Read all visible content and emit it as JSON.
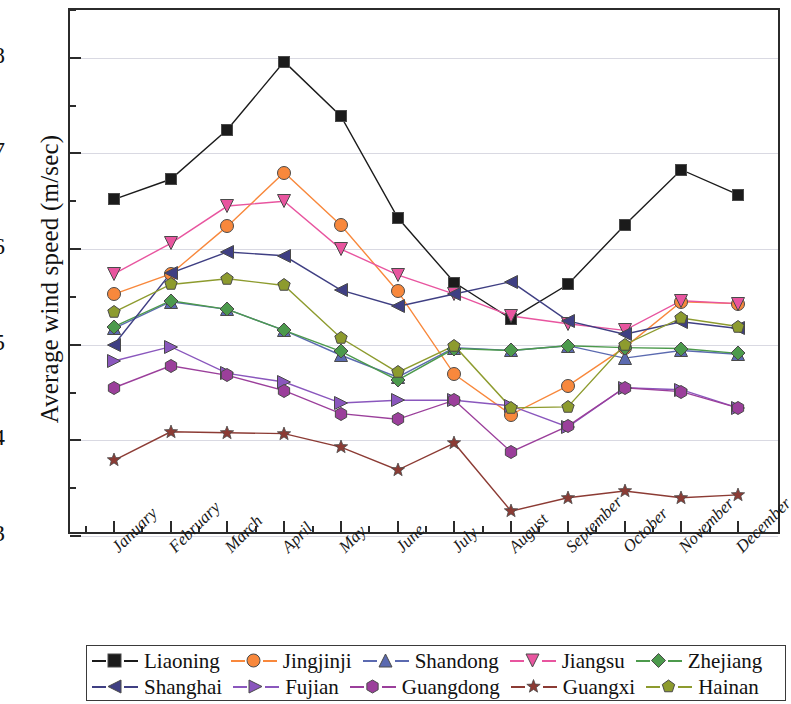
{
  "chart_data": {
    "type": "line",
    "title": "",
    "xlabel": "",
    "ylabel": "Average wind speed (m/sec)",
    "ylim": [
      3,
      8.5
    ],
    "yticks": [
      3,
      4,
      5,
      6,
      7,
      8
    ],
    "ytick_labels": [
      "3",
      "4",
      "5",
      "6",
      "7",
      "8"
    ],
    "minor_yticks": [
      3.5,
      4.5,
      5.5,
      6.5,
      7.5,
      8.5
    ],
    "grid": true,
    "grid_axis": "y",
    "legend_position": "bottom",
    "legend_columns": 5,
    "legend_rows": 2,
    "categories": [
      "January",
      "February",
      "March",
      "April",
      "May",
      "June",
      "July",
      "August",
      "September",
      "October",
      "November",
      "December"
    ],
    "series": [
      {
        "name": "Liaoning",
        "color": "#1b1b1b",
        "marker": "square",
        "values": [
          6.52,
          6.73,
          7.25,
          7.96,
          7.39,
          6.33,
          5.65,
          5.27,
          5.63,
          6.25,
          6.83,
          6.57
        ]
      },
      {
        "name": "Jingjinji",
        "color": "#f8883c",
        "marker": "circle",
        "values": [
          5.53,
          5.74,
          6.24,
          6.8,
          6.25,
          5.56,
          4.69,
          4.27,
          4.57,
          4.97,
          5.45,
          5.43
        ]
      },
      {
        "name": "Shandong",
        "color": "#5b6ab0",
        "marker": "triangle-up",
        "values": [
          5.17,
          5.45,
          5.37,
          5.15,
          4.89,
          4.66,
          4.97,
          4.94,
          4.99,
          4.86,
          4.94,
          4.9
        ]
      },
      {
        "name": "Jiangsu",
        "color": "#e8559f",
        "marker": "triangle-down",
        "values": [
          5.74,
          6.06,
          6.45,
          6.5,
          6.0,
          5.73,
          5.53,
          5.3,
          5.22,
          5.15,
          5.46,
          5.43
        ]
      },
      {
        "name": "Zhejiang",
        "color": "#4c9a4c",
        "marker": "diamond",
        "values": [
          5.19,
          5.46,
          5.37,
          5.15,
          4.93,
          4.63,
          4.96,
          4.94,
          4.99,
          4.97,
          4.96,
          4.91
        ]
      },
      {
        "name": "Shanghai",
        "color": "#3f3f83",
        "marker": "triangle-left",
        "values": [
          5.0,
          5.75,
          5.97,
          5.93,
          5.57,
          5.4,
          5.53,
          5.66,
          5.25,
          5.11,
          5.24,
          5.17
        ]
      },
      {
        "name": "Fujian",
        "color": "#8a57bd",
        "marker": "triangle-right",
        "values": [
          4.83,
          4.98,
          4.7,
          4.61,
          4.39,
          4.42,
          4.42,
          4.36,
          4.14,
          4.55,
          4.53,
          4.34
        ]
      },
      {
        "name": "Guangdong",
        "color": "#9b3f9b",
        "marker": "hexagon",
        "values": [
          4.55,
          4.78,
          4.68,
          4.52,
          4.28,
          4.22,
          4.42,
          3.88,
          4.15,
          4.55,
          4.51,
          4.34
        ]
      },
      {
        "name": "Guangxi",
        "color": "#8c3b34",
        "marker": "star",
        "values": [
          3.79,
          4.09,
          4.08,
          4.07,
          3.93,
          3.69,
          3.97,
          3.26,
          3.4,
          3.47,
          3.4,
          3.43
        ]
      },
      {
        "name": "Hainan",
        "color": "#8d9b2e",
        "marker": "pentagon",
        "values": [
          5.34,
          5.63,
          5.69,
          5.62,
          5.07,
          4.71,
          4.99,
          4.34,
          4.35,
          5.0,
          5.28,
          5.19
        ]
      }
    ]
  },
  "axis": {
    "y_title": "Average wind speed (m/sec)"
  },
  "legend": {
    "row1": [
      {
        "label": "Liaoning"
      },
      {
        "label": "Jingjinji"
      },
      {
        "label": "Shandong"
      },
      {
        "label": "Jiangsu"
      },
      {
        "label": "Zhejiang"
      }
    ],
    "row2": [
      {
        "label": "Shanghai"
      },
      {
        "label": "Fujian"
      },
      {
        "label": "Guangdong"
      },
      {
        "label": "Guangxi"
      },
      {
        "label": "Hainan"
      }
    ]
  }
}
